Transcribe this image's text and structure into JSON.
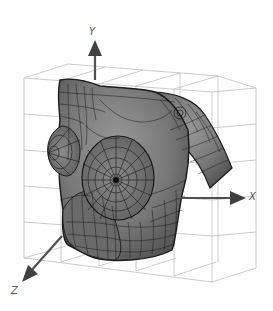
{
  "figure": {
    "axes": {
      "y": {
        "label": "Y"
      },
      "x": {
        "label": "X"
      },
      "z": {
        "label": "Z"
      }
    },
    "colors": {
      "background": "#ffffff",
      "grid": "#b8b8b8",
      "mesh_fill": "#7a7a7a",
      "mesh_dark": "#4a4a4a",
      "mesh_lines": "#1a1a1a",
      "axis": "#505050"
    }
  }
}
